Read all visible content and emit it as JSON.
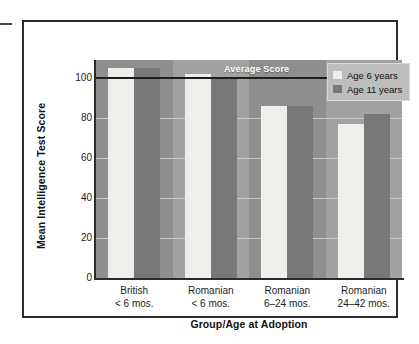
{
  "chart_data": {
    "type": "bar",
    "title": "",
    "xlabel": "Group/Age at Adoption",
    "ylabel": "Mean Intelligence Test Score",
    "categories": [
      "British\n< 6 mos.",
      "Romanian\n< 6 mos.",
      "Romanian\n6–24 mos.",
      "Romanian\n24–42 mos."
    ],
    "category_lines": [
      [
        "British",
        "< 6 mos."
      ],
      [
        "Romanian",
        "< 6 mos."
      ],
      [
        "Romanian",
        "6–24 mos."
      ],
      [
        "Romanian",
        "24–42 mos."
      ]
    ],
    "series": [
      {
        "name": "Age 6 years",
        "values": [
          105,
          102,
          86,
          77
        ],
        "color": "#f0eeea"
      },
      {
        "name": "Age 11 years",
        "values": [
          105,
          100,
          86,
          82
        ],
        "color": "#787878"
      }
    ],
    "ylim": [
      0,
      110
    ],
    "yticks": [
      0,
      20,
      40,
      60,
      80,
      100
    ],
    "ytick_labels": [
      "0",
      "20",
      "40",
      "60",
      "80",
      "100"
    ],
    "grid": true,
    "legend_position": "top-right",
    "annotations": [
      {
        "name": "average-score-line",
        "label": "Average Score",
        "y": 100
      }
    ]
  },
  "legend": {
    "items": [
      {
        "label": "Age 6 years",
        "swatch": "light-swatch"
      },
      {
        "label": "Age 11 years",
        "swatch": "dark-swatch"
      }
    ]
  },
  "colors": {
    "plot_background": "#9a9a9a",
    "band_light": "#a2a2a2",
    "band_dark": "#8f8f8f",
    "gridline": "#c9c9c9",
    "reference_line": "#1d1d1d",
    "frame": "#2b2b2b",
    "series_age6": "#f0eeea",
    "series_age11": "#787878",
    "legend_background": "#bdbdbd",
    "text": "#111111",
    "annotation_text": "#ffffff"
  }
}
